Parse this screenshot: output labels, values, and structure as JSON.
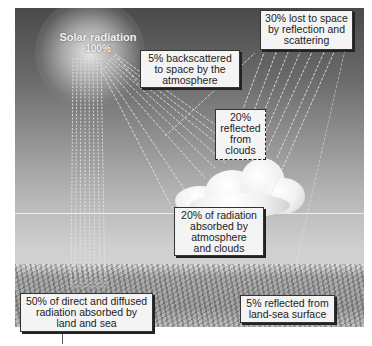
{
  "diagram": {
    "sun": {
      "label": "Solar radiation",
      "value": "100%"
    },
    "labels": {
      "backscattered": [
        "5% backscattered",
        "to space by the",
        "atmosphere"
      ],
      "lost_to_space": [
        "30% lost to space",
        "by reflection and",
        "scattering"
      ],
      "reflected_clouds": [
        "20%",
        "reflected",
        "from",
        "clouds"
      ],
      "absorbed_atmosphere": [
        "20% of radiation",
        "absorbed by",
        "atmosphere",
        "and clouds"
      ],
      "absorbed_land_sea": [
        "50% of direct and diffused",
        "radiation absorbed by",
        "land and sea"
      ],
      "reflected_surface": [
        "5% reflected from",
        "land-sea surface"
      ]
    },
    "colors": {
      "sky_top": "#4a4a4a",
      "sky_bottom": "#dcdcdc",
      "beam": "#e8e8e8",
      "label_bg": "#f4f4f4",
      "label_border": "#333333"
    }
  }
}
